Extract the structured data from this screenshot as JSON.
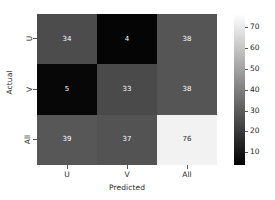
{
  "chart_data": {
    "type": "heatmap",
    "title": "",
    "xlabel": "Predicted",
    "ylabel": "Actual",
    "categories_x": [
      "U",
      "V",
      "All"
    ],
    "categories_y": [
      "U",
      "V",
      "All"
    ],
    "rows": [
      {
        "label": "U",
        "values": [
          34,
          4,
          38
        ]
      },
      {
        "label": "V",
        "values": [
          5,
          33,
          38
        ]
      },
      {
        "label": "All",
        "values": [
          39,
          37,
          76
        ]
      }
    ],
    "cells": [
      {
        "row": "U",
        "col": "U",
        "value": 34,
        "bg": "#4c4c4c",
        "fg": "#ffffff"
      },
      {
        "row": "U",
        "col": "V",
        "value": 4,
        "bg": "#050505",
        "fg": "#ffffff"
      },
      {
        "row": "U",
        "col": "All",
        "value": 38,
        "bg": "#555555",
        "fg": "#ffffff"
      },
      {
        "row": "V",
        "col": "U",
        "value": 5,
        "bg": "#070707",
        "fg": "#ffffff"
      },
      {
        "row": "V",
        "col": "V",
        "value": 33,
        "bg": "#4a4a4a",
        "fg": "#ffffff"
      },
      {
        "row": "V",
        "col": "All",
        "value": 38,
        "bg": "#555555",
        "fg": "#ffffff"
      },
      {
        "row": "All",
        "col": "U",
        "value": 39,
        "bg": "#575757",
        "fg": "#ffffff"
      },
      {
        "row": "All",
        "col": "V",
        "value": 37,
        "bg": "#535353",
        "fg": "#ffffff"
      },
      {
        "row": "All",
        "col": "All",
        "value": 76,
        "bg": "#f2f2f2",
        "fg": "#2b2b2b"
      }
    ],
    "colorbar": {
      "ticks": [
        70,
        60,
        50,
        40,
        30,
        20,
        10
      ],
      "vmin": 4,
      "vmax": 76,
      "cmap": "greys",
      "position": "right",
      "low_color": "#000000",
      "high_color": "#ffffff"
    },
    "grid": false,
    "legend": "none"
  },
  "axis": {
    "x_label": "Predicted",
    "y_label": "Actual",
    "x_ticks": [
      "U",
      "V",
      "All"
    ],
    "y_ticks": [
      "U",
      "V",
      "All"
    ]
  },
  "colors": {
    "text": "#262626",
    "tick": "#5a5a5a",
    "background": "#ffffff"
  }
}
